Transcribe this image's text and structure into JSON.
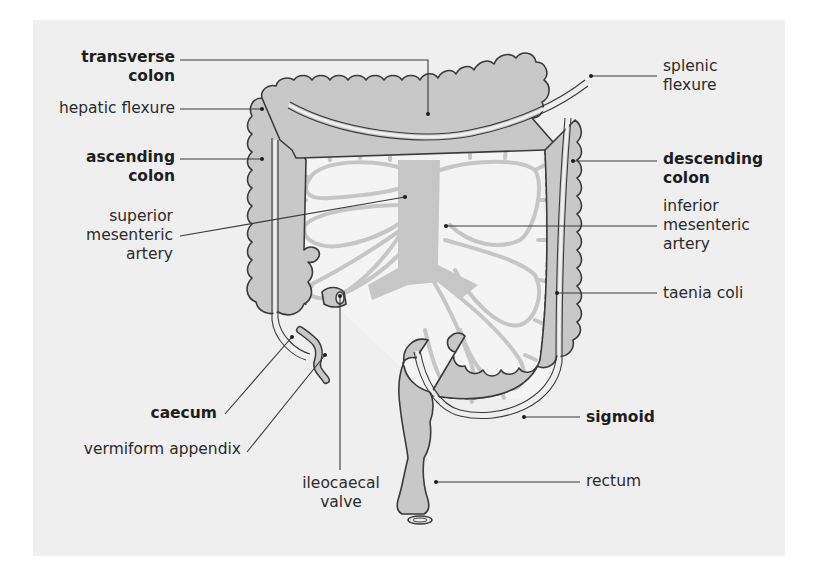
{
  "diagram": {
    "colors": {
      "background": "#efefef",
      "colon_fill": "#c8c8c8",
      "colon_outline": "#3a3a3a",
      "mesentery_vessels": "#c6c6c6",
      "mesentery_space": "#f4f4f4",
      "leader_line": "#3a3a3a",
      "text": "#2b2b2b"
    },
    "labels": {
      "transverse_colon": [
        "transverse",
        "colon"
      ],
      "hepatic_flexure": [
        "hepatic flexure"
      ],
      "ascending_colon": [
        "ascending",
        "colon"
      ],
      "superior_mesenteric_artery": [
        "superior",
        "mesenteric",
        "artery"
      ],
      "caecum": [
        "caecum"
      ],
      "vermiform_appendix": [
        "vermiform appendix"
      ],
      "ileocaecal_valve": [
        "ileocaecal",
        "valve"
      ],
      "splenic_flexure": [
        "splenic",
        "flexure"
      ],
      "descending_colon": [
        "descending",
        "colon"
      ],
      "inferior_mesenteric_artery": [
        "inferior",
        "mesenteric",
        "artery"
      ],
      "taenia_coli": [
        "taenia coli"
      ],
      "sigmoid": [
        "sigmoid"
      ],
      "rectum": [
        "rectum"
      ]
    },
    "bold_labels": [
      "transverse colon",
      "ascending colon",
      "descending colon",
      "caecum",
      "sigmoid"
    ]
  }
}
